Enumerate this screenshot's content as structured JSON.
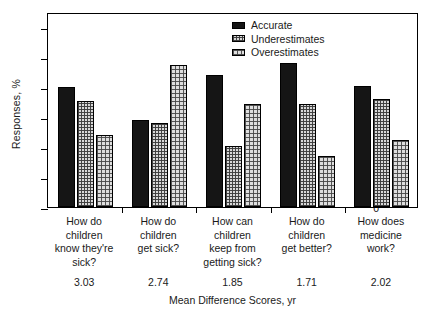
{
  "chart_data": {
    "type": "bar",
    "title": "",
    "xlabel": "Mean Difference Scores, yr",
    "ylabel": "Responses, %",
    "ylim": [
      0,
      65
    ],
    "yticks": [
      0,
      10,
      20,
      30,
      40,
      50,
      60
    ],
    "grid": false,
    "legend_position": "top-right",
    "categories": [
      "How do children know they're sick?",
      "How do children get sick?",
      "How can children keep from getting sick?",
      "How do children get better?",
      "How does medicine work?"
    ],
    "category_lines": [
      [
        "How do",
        "children",
        "know they're",
        "sick?"
      ],
      [
        "How do",
        "children",
        "get sick?"
      ],
      [
        "How can",
        "children",
        "keep from",
        "getting sick?"
      ],
      [
        "How do",
        "children",
        "get better?"
      ],
      [
        "How does",
        "medicine",
        "work?"
      ]
    ],
    "series": [
      {
        "name": "Accurate",
        "values": [
          40.0,
          29.0,
          44.0,
          48.0,
          40.5
        ]
      },
      {
        "name": "Underestimates",
        "values": [
          35.5,
          28.0,
          20.5,
          34.5,
          36.0
        ]
      },
      {
        "name": "Overestimates",
        "values": [
          24.0,
          47.5,
          34.5,
          17.0,
          22.5
        ]
      }
    ],
    "secondary_axis": {
      "label": "Mean Difference Scores, yr",
      "values": [
        "3.03",
        "2.74",
        "1.85",
        "1.71",
        "2.02"
      ]
    }
  },
  "legend": {
    "items": [
      {
        "label": "Accurate",
        "swatch": "solid-black"
      },
      {
        "label": "Underestimates",
        "swatch": "fine-hatch"
      },
      {
        "label": "Overestimates",
        "swatch": "coarse-hatch"
      }
    ]
  },
  "colors": {
    "accurate": "#151515",
    "underestimates": "#d8d8d8",
    "overestimates": "#dedede",
    "axis": "#000000",
    "background": "#ffffff"
  }
}
